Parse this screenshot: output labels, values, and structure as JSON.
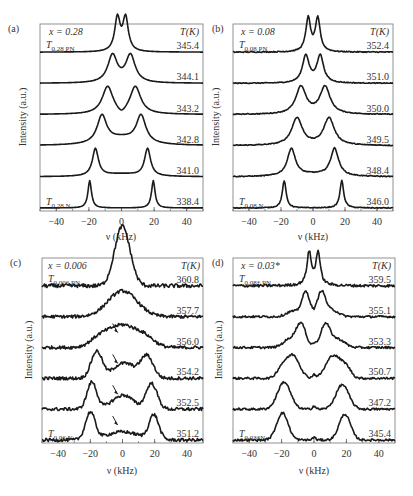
{
  "figure": {
    "xlabel": "ν (kHz)",
    "ylabel": "Intensity (a.u.)",
    "temp_header": "T(K)",
    "xticks": [
      -40,
      -20,
      0,
      20,
      40
    ],
    "xlim": [
      -50,
      50
    ]
  },
  "chart_data": [
    {
      "type": "line",
      "panel": "(a)",
      "composition": "x = 0.28",
      "top_label": {
        "main": "T",
        "sub": "0.28 PN"
      },
      "bottom_label": {
        "main": "T",
        "sub": "0.28 N"
      },
      "xlabel": "ν (kHz)",
      "ylabel": "Intensity (a.u.)",
      "xlim": [
        -50,
        50
      ],
      "noise": 0,
      "series": [
        {
          "name": "345.4",
          "peaks": [
            [
              -2.5,
              2.0,
              1.0
            ],
            [
              2.5,
              2.0,
              1.0
            ]
          ],
          "shape": "lor"
        },
        {
          "name": "344.1",
          "peaks": [
            [
              -5.5,
              3.5,
              1.0
            ],
            [
              5.5,
              3.5,
              1.0
            ]
          ],
          "shape": "lor"
        },
        {
          "name": "343.2",
          "peaks": [
            [
              -8.5,
              4.0,
              1.0
            ],
            [
              8.5,
              4.0,
              1.0
            ],
            [
              0,
              3,
              -0.2
            ]
          ],
          "shape": "lor"
        },
        {
          "name": "342.8",
          "peaks": [
            [
              -12,
              3.5,
              1.0
            ],
            [
              12,
              3.5,
              1.0
            ],
            [
              0,
              12,
              0.25
            ]
          ],
          "shape": "lor"
        },
        {
          "name": "341.0",
          "peaks": [
            [
              -16,
              2.2,
              1.0
            ],
            [
              16,
              2.2,
              1.0
            ],
            [
              0,
              14,
              0.1
            ]
          ],
          "shape": "lor"
        },
        {
          "name": "338.4",
          "peaks": [
            [
              -19.5,
              1.3,
              1.0
            ],
            [
              19.5,
              1.3,
              1.0
            ]
          ],
          "shape": "lor"
        }
      ]
    },
    {
      "type": "line",
      "panel": "(b)",
      "composition": "x = 0.08",
      "top_label": {
        "main": "T",
        "sub": "0.08 PN"
      },
      "bottom_label": {
        "main": "T",
        "sub": "0.08 N"
      },
      "xlabel": "ν (kHz)",
      "ylabel": "Intensity (a.u.)",
      "xlim": [
        -50,
        50
      ],
      "noise": 0.015,
      "series": [
        {
          "name": "352.4",
          "peaks": [
            [
              -3,
              1.8,
              1.0
            ],
            [
              3,
              1.8,
              1.0
            ]
          ],
          "shape": "lor"
        },
        {
          "name": "351.0",
          "peaks": [
            [
              -4.5,
              2.5,
              1.0
            ],
            [
              4.5,
              2.5,
              1.0
            ]
          ],
          "shape": "lor"
        },
        {
          "name": "350.0",
          "peaks": [
            [
              -7.5,
              3.8,
              1.0
            ],
            [
              7.5,
              3.8,
              1.0
            ]
          ],
          "shape": "lor"
        },
        {
          "name": "349.5",
          "peaks": [
            [
              -10,
              4.0,
              1.0
            ],
            [
              10,
              4.0,
              1.0
            ]
          ],
          "shape": "lor"
        },
        {
          "name": "348.4",
          "peaks": [
            [
              -13.5,
              3.0,
              1.0
            ],
            [
              13.5,
              3.0,
              1.0
            ],
            [
              0,
              14,
              0.08
            ]
          ],
          "shape": "lor"
        },
        {
          "name": "346.0",
          "peaks": [
            [
              -18,
              1.4,
              1.0
            ],
            [
              18,
              1.4,
              1.0
            ]
          ],
          "shape": "lor"
        }
      ]
    },
    {
      "type": "line",
      "panel": "(c)",
      "composition": "x = 0.006",
      "top_label": {
        "main": "T",
        "sub": "0.006 PN"
      },
      "bottom_label": {
        "main": "T",
        "sub": "0.06 N"
      },
      "xlabel": "ν (kHz)",
      "ylabel": "Intensity (a.u.)",
      "xlim": [
        -50,
        50
      ],
      "noise": 0.06,
      "arrows_at_kHz": [
        -3,
        -3,
        -3,
        -3
      ],
      "series": [
        {
          "name": "360.8",
          "peaks": [
            [
              -1.5,
              4.5,
              1.0
            ],
            [
              1.5,
              4.5,
              0.9
            ]
          ],
          "shape": "gau"
        },
        {
          "name": "357.7",
          "peaks": [
            [
              0,
              9.0,
              0.95
            ]
          ],
          "shape": "gau"
        },
        {
          "name": "356.0",
          "peaks": [
            [
              0,
              8.0,
              0.8
            ],
            [
              -14,
              6,
              0.35
            ],
            [
              14,
              6,
              0.35
            ]
          ],
          "shape": "gau"
        },
        {
          "name": "354.2",
          "peaks": [
            [
              -16,
              3.5,
              1.0
            ],
            [
              15,
              4.0,
              0.85
            ],
            [
              -2,
              5,
              0.45
            ],
            [
              5,
              4,
              0.3
            ]
          ],
          "shape": "gau"
        },
        {
          "name": "352.5",
          "peaks": [
            [
              -19,
              3.0,
              1.0
            ],
            [
              18,
              3.5,
              0.95
            ],
            [
              -3,
              6,
              0.3
            ],
            [
              3,
              5,
              0.3
            ]
          ],
          "shape": "gau"
        },
        {
          "name": "351.2",
          "peaks": [
            [
              -20,
              3.0,
              1.0
            ],
            [
              19.5,
              3.0,
              0.9
            ],
            [
              0,
              10,
              0.3
            ]
          ],
          "shape": "gau"
        }
      ]
    },
    {
      "type": "line",
      "panel": "(d)",
      "composition": "x = 0.03*",
      "top_label": {
        "main": "T",
        "sub": "0.08* PN"
      },
      "bottom_label": {
        "main": "T",
        "sub": "0.03*N"
      },
      "xlabel": "ν (kHz)",
      "ylabel": "Intensity (a.u.)",
      "xlim": [
        -50,
        50
      ],
      "noise": 0.04,
      "series": [
        {
          "name": "359.5",
          "peaks": [
            [
              -3,
              1.6,
              1.0
            ],
            [
              2.5,
              1.6,
              1.0
            ]
          ],
          "shape": "lor"
        },
        {
          "name": "355.1",
          "peaks": [
            [
              -5,
              2.5,
              0.9
            ],
            [
              4.5,
              2.5,
              0.9
            ],
            [
              -13,
              4,
              0.2
            ],
            [
              11,
              4,
              0.25
            ]
          ],
          "shape": "gau"
        },
        {
          "name": "353.3",
          "peaks": [
            [
              -8,
              3.0,
              0.85
            ],
            [
              7,
              3.0,
              0.85
            ],
            [
              -15,
              4,
              0.3
            ],
            [
              15,
              4,
              0.3
            ],
            [
              0,
              1,
              0.1
            ]
          ],
          "shape": "gau"
        },
        {
          "name": "350.7",
          "peaks": [
            [
              -13,
              4.0,
              0.85
            ],
            [
              12,
              4.5,
              0.85
            ],
            [
              -20,
              3,
              0.35
            ],
            [
              20,
              3,
              0.35
            ],
            [
              0,
              1,
              0.12
            ]
          ],
          "shape": "gau"
        },
        {
          "name": "347.2",
          "peaks": [
            [
              -18.5,
              4.0,
              1.0
            ],
            [
              17.5,
              4.0,
              0.9
            ],
            [
              0,
              1,
              0.12
            ]
          ],
          "shape": "gau"
        },
        {
          "name": "345.4",
          "peaks": [
            [
              -19.5,
              3.5,
              1.0
            ],
            [
              19,
              3.5,
              0.95
            ],
            [
              0,
              1,
              0.1
            ]
          ],
          "shape": "gau"
        }
      ]
    }
  ]
}
